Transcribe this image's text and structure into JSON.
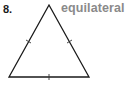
{
  "problem": {
    "number": "8.",
    "answer": "equilateral"
  },
  "diagram": {
    "shape": "triangle",
    "vertices": [
      [
        49,
        5
      ],
      [
        9,
        77
      ],
      [
        89,
        77
      ]
    ],
    "congruence_marks": 3,
    "stroke_color": "#1a1a1a",
    "answer_color": "#8a8a8a"
  }
}
